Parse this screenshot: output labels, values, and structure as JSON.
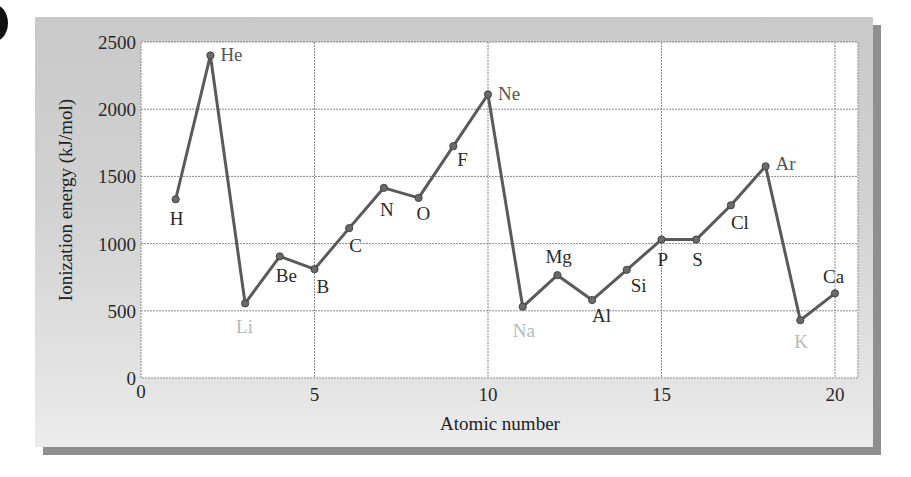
{
  "chart_data": {
    "type": "line",
    "title": "",
    "xlabel": "Atomic number",
    "ylabel": "Ionization energy (kJ/mol)",
    "xlim": [
      0,
      20.7
    ],
    "ylim": [
      0,
      2500
    ],
    "xticks": [
      0,
      5,
      10,
      15,
      20
    ],
    "yticks": [
      0,
      500,
      1000,
      1500,
      2000,
      2500
    ],
    "grid": true,
    "legend": null,
    "x": [
      1,
      2,
      3,
      4,
      5,
      6,
      7,
      8,
      9,
      10,
      11,
      12,
      13,
      14,
      15,
      16,
      17,
      18,
      19,
      20
    ],
    "series": [
      {
        "name": "First ionization energy",
        "values": [
          1330,
          2400,
          555,
          905,
          810,
          1115,
          1415,
          1340,
          1725,
          2110,
          530,
          765,
          580,
          805,
          1030,
          1030,
          1285,
          1575,
          430,
          630
        ]
      }
    ],
    "point_labels": [
      {
        "x": 1,
        "text": "H",
        "dx": -6,
        "dy": 26,
        "color": "#2a2a2a"
      },
      {
        "x": 2,
        "text": "He",
        "dx": 10,
        "dy": 6,
        "color": "#555555"
      },
      {
        "x": 3,
        "text": "Li",
        "dx": -9,
        "dy": 30,
        "color": "#b8b8b8"
      },
      {
        "x": 4,
        "text": "Be",
        "dx": -4,
        "dy": 26,
        "color": "#2a2a2a"
      },
      {
        "x": 5,
        "text": "B",
        "dx": 2,
        "dy": 24,
        "color": "#2a2a2a"
      },
      {
        "x": 6,
        "text": "C",
        "dx": 0,
        "dy": 24,
        "color": "#2a2a2a"
      },
      {
        "x": 7,
        "text": "N",
        "dx": -4,
        "dy": 28,
        "color": "#2a2a2a"
      },
      {
        "x": 8,
        "text": "O",
        "dx": -2,
        "dy": 22,
        "color": "#2a2a2a"
      },
      {
        "x": 9,
        "text": "F",
        "dx": 4,
        "dy": 20,
        "color": "#2a2a2a"
      },
      {
        "x": 10,
        "text": "Ne",
        "dx": 10,
        "dy": 6,
        "color": "#555555"
      },
      {
        "x": 11,
        "text": "Na",
        "dx": -10,
        "dy": 30,
        "color": "#b8b8b8"
      },
      {
        "x": 12,
        "text": "Mg",
        "dx": -12,
        "dy": -12,
        "color": "#2a2a2a"
      },
      {
        "x": 13,
        "text": "Al",
        "dx": 0,
        "dy": 22,
        "color": "#2a2a2a"
      },
      {
        "x": 14,
        "text": "Si",
        "dx": 4,
        "dy": 22,
        "color": "#2a2a2a"
      },
      {
        "x": 15,
        "text": "P",
        "dx": -4,
        "dy": 26,
        "color": "#2a2a2a"
      },
      {
        "x": 16,
        "text": "S",
        "dx": -4,
        "dy": 26,
        "color": "#2a2a2a"
      },
      {
        "x": 17,
        "text": "Cl",
        "dx": 0,
        "dy": 24,
        "color": "#2a2a2a"
      },
      {
        "x": 18,
        "text": "Ar",
        "dx": 10,
        "dy": 4,
        "color": "#555555"
      },
      {
        "x": 19,
        "text": "K",
        "dx": -6,
        "dy": 28,
        "color": "#b8b8b8"
      },
      {
        "x": 20,
        "text": "Ca",
        "dx": -12,
        "dy": -10,
        "color": "#2a2a2a"
      }
    ],
    "colors": {
      "line": "#5a5a5a",
      "marker": "#6a6a6a",
      "plot_bg": "#ffffff",
      "grid": "#8a8a8a",
      "panel_bg": "#cfcfcf"
    }
  }
}
